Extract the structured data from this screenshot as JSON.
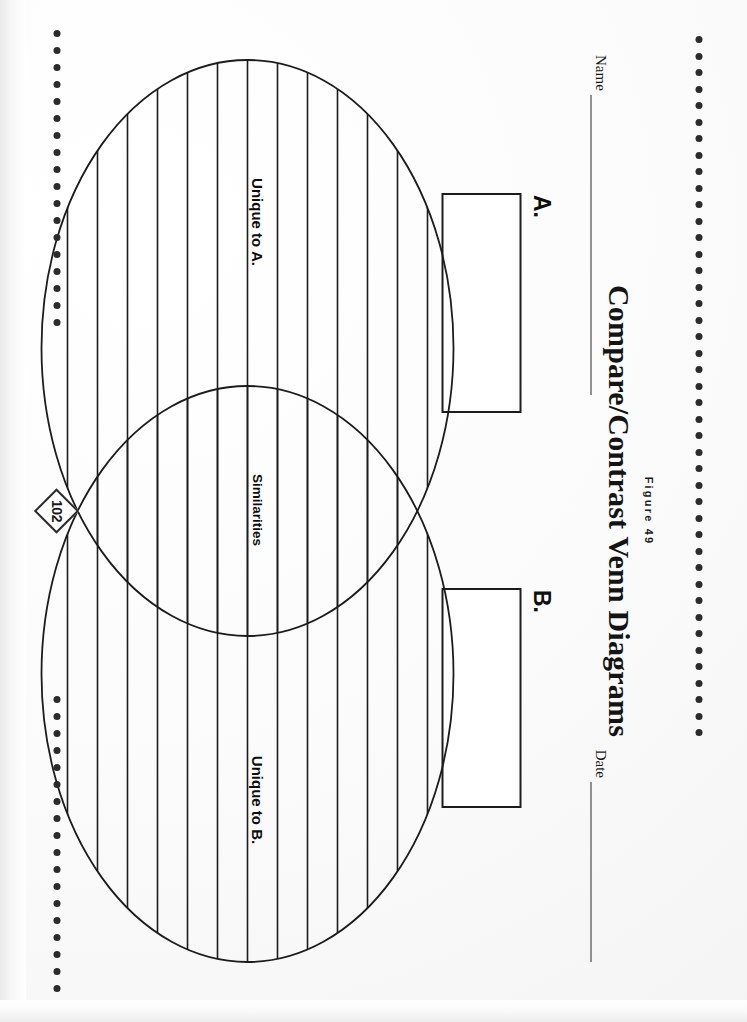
{
  "page": {
    "figure_label": "Figure 49",
    "title": "Compare/Contrast Venn Diagrams",
    "page_number": "102",
    "ink_color": "#1a1a1a",
    "paper_color": "#fefefe"
  },
  "fields": {
    "name_label": "Name",
    "name_value": "",
    "name_placeholder": "",
    "date_label": "Date",
    "date_value": "",
    "date_placeholder": ""
  },
  "answer_boxes": [
    {
      "letter": "A.",
      "value": "",
      "placeholder": ""
    },
    {
      "letter": "B.",
      "value": "",
      "placeholder": ""
    }
  ],
  "venn": {
    "labels": {
      "left": "Unique to A.",
      "center": "Similarities",
      "right": "Unique to B."
    },
    "circle_count": 2,
    "rule_line_count": 13,
    "stroke_color": "#1c1c1c"
  },
  "decor": {
    "top_dot_count": 43,
    "bottom_left_dot_count": 18,
    "bottom_right_dot_count": 18,
    "dot_color": "#2b2b2b"
  }
}
